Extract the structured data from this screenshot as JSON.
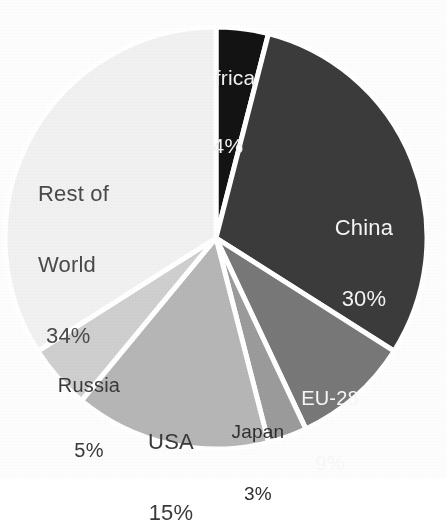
{
  "chart_data": {
    "type": "pie",
    "title": "",
    "subtitle": "",
    "xlabel": "",
    "ylabel": "",
    "legend_position": "none",
    "grid": false,
    "labels_inside": true,
    "total": 100,
    "unit": "%",
    "categories": [
      "Africa",
      "China",
      "EU-28",
      "Japan",
      "USA",
      "Russia",
      "Rest of World"
    ],
    "values": [
      4,
      30,
      9,
      3,
      15,
      5,
      34
    ],
    "slices": [
      {
        "label": "Africa",
        "value": 4,
        "value_text": "4%",
        "color": "#131313",
        "text_color": "#f2f2f2",
        "start_angle": 0,
        "end_angle": 14.4
      },
      {
        "label": "China",
        "value": 30,
        "value_text": "30%",
        "color": "#3b3b3b",
        "text_color": "#f5f5f5",
        "start_angle": 14.4,
        "end_angle": 122.4
      },
      {
        "label": "EU-28",
        "value": 9,
        "value_text": "9%",
        "color": "#787878",
        "text_color": "#f7f7f7",
        "start_angle": 122.4,
        "end_angle": 154.8
      },
      {
        "label": "Japan",
        "value": 3,
        "value_text": "3%",
        "color": "#9b9b9b",
        "text_color": "#2f2f2f",
        "start_angle": 154.8,
        "end_angle": 165.6
      },
      {
        "label": "USA",
        "value": 15,
        "value_text": "15%",
        "color": "#b6b6b6",
        "text_color": "#3a3a3a",
        "start_angle": 165.6,
        "end_angle": 219.6
      },
      {
        "label": "Russia",
        "value": 5,
        "value_text": "5%",
        "color": "#cfcfcf",
        "text_color": "#3a3a3a",
        "start_angle": 219.6,
        "end_angle": 237.6
      },
      {
        "label": "Rest of World",
        "value": 34,
        "value_text": "34%",
        "color": "#f1f1f1",
        "text_color": "#4a4a4a",
        "start_angle": 237.6,
        "end_angle": 360
      }
    ]
  },
  "labels": {
    "africa": {
      "name": "Africa",
      "value": "4%"
    },
    "china": {
      "name": "China",
      "value": "30%"
    },
    "eu28": {
      "name": "EU-28",
      "value": "9%"
    },
    "japan": {
      "name": "Japan",
      "value": "3%"
    },
    "usa": {
      "name": "USA",
      "value": "15%"
    },
    "russia": {
      "name": "Russia",
      "value": "5%"
    },
    "rest_of_world": {
      "name_line1": "Rest of",
      "name_line2": "World",
      "value": "34%"
    }
  },
  "colors": {
    "background": "#fdfdfd",
    "slice_gap": "#ffffff",
    "africa": "#131313",
    "china": "#3b3b3b",
    "eu28": "#787878",
    "japan": "#9b9b9b",
    "usa": "#b6b6b6",
    "russia": "#cfcfcf",
    "rest_of_world": "#f1f1f1"
  }
}
